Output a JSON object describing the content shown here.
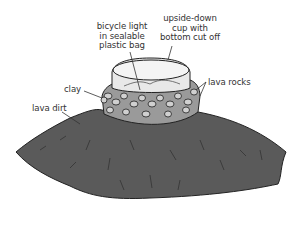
{
  "diagram": {
    "labels": {
      "bicycle_light": [
        "bicycle light",
        "in sealable",
        "plastic bag"
      ],
      "cup": [
        "upside-down",
        "cup with",
        "bottom cut off"
      ],
      "lava_rocks": "lava rocks",
      "clay": "clay",
      "lava_dirt": "lava dirt"
    },
    "colors": {
      "dirt": "#5a5a5a",
      "clay": "#9a9a9a",
      "rocks": "#c8c8c8",
      "cup": "#e8e8e8",
      "outline": "#222222",
      "text": "#333333"
    }
  }
}
